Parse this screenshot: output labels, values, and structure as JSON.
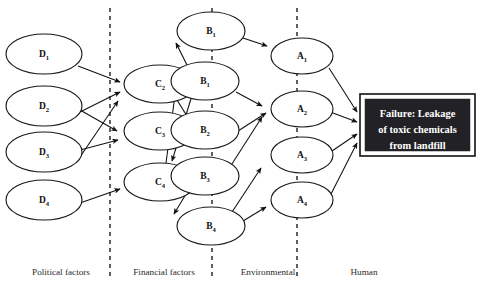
{
  "diagram": {
    "type": "causal-factor-tree",
    "outcome": {
      "name": "outcome-event",
      "line1": "Failure: Leakage",
      "line2": "of toxic chemicals",
      "line3": "from landfill",
      "text_color": "#ffffff",
      "fill_color": "#222226"
    },
    "lanes": [
      {
        "id": "political",
        "label": "Political factors",
        "caption_x": 61
      },
      {
        "id": "financial",
        "label": "Financial factors",
        "caption_x": 164
      },
      {
        "id": "environmental",
        "label": "Environmental",
        "caption_x": 268
      },
      {
        "id": "human",
        "label": "Human",
        "caption_x": 364
      }
    ],
    "dividers_x": [
      110,
      212,
      297
    ],
    "columns": [
      {
        "id": "D",
        "lane": "political",
        "nodes": [
          {
            "id": "D1",
            "base": "D",
            "sub": "1",
            "cx": 44,
            "cy": 54,
            "rx": 38,
            "ry": 20
          },
          {
            "id": "D2",
            "base": "D",
            "sub": "2",
            "cx": 44,
            "cy": 106,
            "rx": 38,
            "ry": 20
          },
          {
            "id": "D3",
            "base": "D",
            "sub": "3",
            "cx": 44,
            "cy": 152,
            "rx": 38,
            "ry": 20
          },
          {
            "id": "D4",
            "base": "D",
            "sub": "4",
            "cx": 44,
            "cy": 200,
            "rx": 38,
            "ry": 20
          }
        ]
      },
      {
        "id": "C",
        "lane": "financial",
        "nodes": [
          {
            "id": "C2",
            "base": "C",
            "sub": "2",
            "cx": 160,
            "cy": 84,
            "rx": 36,
            "ry": 19
          },
          {
            "id": "C3",
            "base": "C",
            "sub": "3",
            "cx": 160,
            "cy": 131,
            "rx": 36,
            "ry": 19
          },
          {
            "id": "C4",
            "base": "C",
            "sub": "4",
            "cx": 160,
            "cy": 182,
            "rx": 36,
            "ry": 19
          }
        ]
      },
      {
        "id": "B",
        "lane": "environmental",
        "nodes": [
          {
            "id": "Btop",
            "base": "B",
            "sub": "1",
            "cx": 211,
            "cy": 31,
            "rx": 34,
            "ry": 19
          },
          {
            "id": "B1",
            "base": "B",
            "sub": "1",
            "cx": 205,
            "cy": 81,
            "rx": 34,
            "ry": 19
          },
          {
            "id": "B2",
            "base": "B",
            "sub": "2",
            "cx": 205,
            "cy": 130,
            "rx": 34,
            "ry": 19
          },
          {
            "id": "B3",
            "base": "B",
            "sub": "3",
            "cx": 205,
            "cy": 176,
            "rx": 34,
            "ry": 19
          },
          {
            "id": "B4",
            "base": "B",
            "sub": "4",
            "cx": 211,
            "cy": 226,
            "rx": 34,
            "ry": 19
          }
        ]
      },
      {
        "id": "A",
        "lane": "human",
        "nodes": [
          {
            "id": "A1",
            "base": "A",
            "sub": "1",
            "cx": 302,
            "cy": 56,
            "rx": 31,
            "ry": 18
          },
          {
            "id": "A2",
            "base": "A",
            "sub": "2",
            "cx": 302,
            "cy": 109,
            "rx": 31,
            "ry": 18
          },
          {
            "id": "A3",
            "base": "A",
            "sub": "3",
            "cx": 302,
            "cy": 155,
            "rx": 31,
            "ry": 18
          },
          {
            "id": "A4",
            "base": "A",
            "sub": "4",
            "cx": 302,
            "cy": 200,
            "rx": 31,
            "ry": 18
          }
        ]
      }
    ],
    "outcome_box": {
      "x": 360,
      "y": 94,
      "w": 115,
      "h": 62
    },
    "edges": [
      {
        "from": "D1",
        "to": "C2",
        "path": "M 78,66 L 120,82"
      },
      {
        "from": "D2",
        "to": "C2",
        "path": "M 76,114 L 120,92"
      },
      {
        "from": "D2",
        "to": "C3",
        "path": "M 80,110 L 117,131"
      },
      {
        "from": "D3",
        "to": "C2",
        "path": "M 80,157 L 118,101"
      },
      {
        "from": "D3",
        "to": "C3",
        "path": "M 80,150 L 118,140"
      },
      {
        "from": "D4",
        "to": "C4",
        "path": "M 80,203 L 120,189"
      },
      {
        "from": "C2",
        "to": "Btop",
        "path": "M 191,73 L 176,43"
      },
      {
        "from": "C2",
        "to": "B3",
        "path": "M 193,92 L 172,161"
      },
      {
        "from": "C3",
        "to": "B1",
        "path": "M 192,124 L 172,92"
      },
      {
        "from": "C4",
        "to": "B1",
        "path": "M 166,163 L 175,95"
      },
      {
        "from": "C4",
        "to": "B4",
        "path": "M 186,194 L 174,214"
      },
      {
        "from": "Btop",
        "to": "A1",
        "path": "M 243,38 L 267,46"
      },
      {
        "from": "B1",
        "to": "A2",
        "path": "M 236,92 L 262,106"
      },
      {
        "from": "B2",
        "to": "A2",
        "path": "M 238,131 L 266,113"
      },
      {
        "from": "B3",
        "to": "A2",
        "path": "M 230,167 L 262,117"
      },
      {
        "from": "B4",
        "to": "A3",
        "path": "M 232,212 L 261,168"
      },
      {
        "from": "B4",
        "to": "A4",
        "path": "M 243,221 L 266,207"
      },
      {
        "from": "A1",
        "to": "outcome",
        "path": "M 329,68 L 357,112"
      },
      {
        "from": "A2",
        "to": "outcome",
        "path": "M 333,113 L 357,122"
      },
      {
        "from": "A3",
        "to": "outcome",
        "path": "M 332,151 L 357,134"
      },
      {
        "from": "A4",
        "to": "outcome",
        "path": "M 331,194 L 357,143"
      }
    ]
  }
}
